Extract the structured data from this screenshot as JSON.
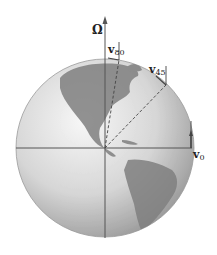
{
  "figure": {
    "labels": {
      "omega": "Ω",
      "v80": {
        "symbol": "v",
        "subscript": "80"
      },
      "v45": {
        "symbol": "v",
        "subscript": "45"
      },
      "v0": {
        "symbol": "v",
        "subscript": "0"
      }
    },
    "colors": {
      "background": "#ffffff",
      "globe_light": "#f2f2f2",
      "globe_mid": "#c8c8c8",
      "globe_dark": "#8a8a8a",
      "land": "#7d7d7d",
      "axis_line": "#555555",
      "label_text": "#222222"
    }
  }
}
